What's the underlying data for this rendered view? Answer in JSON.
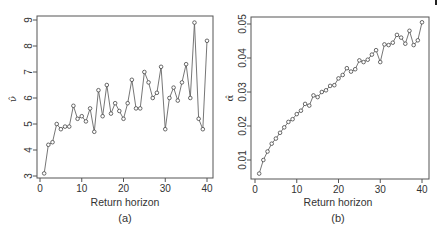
{
  "chart_data": [
    {
      "type": "line",
      "panel_label": "(a)",
      "xlabel": "Return horizon",
      "ylabel": "ν̂",
      "xlim": [
        0,
        40
      ],
      "ylim": [
        3,
        9
      ],
      "xticks": [
        0,
        10,
        20,
        30,
        40
      ],
      "yticks": [
        3,
        4,
        5,
        6,
        7,
        8,
        9
      ],
      "grid": false,
      "marker": "open-circle",
      "x": [
        1,
        2,
        3,
        4,
        5,
        6,
        7,
        8,
        9,
        10,
        11,
        12,
        13,
        14,
        15,
        16,
        17,
        18,
        19,
        20,
        21,
        22,
        23,
        24,
        25,
        26,
        27,
        28,
        29,
        30,
        31,
        32,
        33,
        34,
        35,
        36,
        37,
        38,
        39,
        40
      ],
      "values": [
        3.1,
        4.2,
        4.3,
        5.0,
        4.8,
        4.9,
        4.9,
        5.7,
        5.2,
        5.3,
        5.1,
        5.6,
        4.7,
        6.3,
        5.3,
        6.5,
        5.4,
        5.8,
        5.5,
        5.2,
        5.8,
        6.7,
        5.6,
        5.6,
        7.0,
        6.6,
        6.0,
        6.2,
        7.2,
        4.8,
        6.0,
        6.4,
        5.9,
        6.6,
        7.3,
        6.0,
        8.9,
        5.2,
        4.8,
        8.2
      ]
    },
    {
      "type": "line",
      "panel_label": "(b)",
      "xlabel": "Return horizon",
      "ylabel": "α̂",
      "xlim": [
        0,
        40
      ],
      "ylim": [
        0.005,
        0.05
      ],
      "xticks": [
        0,
        10,
        20,
        30,
        40
      ],
      "yticks": [
        0.01,
        0.02,
        0.03,
        0.04,
        0.05
      ],
      "grid": false,
      "marker": "open-circle",
      "x": [
        1,
        2,
        3,
        4,
        5,
        6,
        7,
        8,
        9,
        10,
        11,
        12,
        13,
        14,
        15,
        16,
        17,
        18,
        19,
        20,
        21,
        22,
        23,
        24,
        25,
        26,
        27,
        28,
        29,
        30,
        31,
        32,
        33,
        34,
        35,
        36,
        37,
        38,
        39,
        40
      ],
      "values": [
        0.006,
        0.01,
        0.0125,
        0.0148,
        0.0163,
        0.018,
        0.0196,
        0.0212,
        0.022,
        0.0235,
        0.0245,
        0.0265,
        0.026,
        0.029,
        0.0285,
        0.03,
        0.0305,
        0.0318,
        0.032,
        0.034,
        0.035,
        0.037,
        0.036,
        0.0367,
        0.0393,
        0.0388,
        0.0395,
        0.041,
        0.0423,
        0.0388,
        0.044,
        0.0438,
        0.0445,
        0.0468,
        0.046,
        0.0442,
        0.048,
        0.0438,
        0.0452,
        0.0505
      ]
    }
  ],
  "panels": {
    "a": {
      "xlabel": "Return horizon",
      "ylabel": "ν̂",
      "label": "(a)"
    },
    "b": {
      "xlabel": "Return horizon",
      "ylabel": "α̂",
      "label": "(b)"
    }
  }
}
